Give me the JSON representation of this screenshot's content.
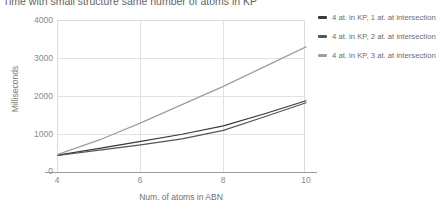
{
  "chart_data": {
    "type": "line",
    "title": "Time with small structure same number of atoms in KP",
    "xlabel": "Num. of atoms in ABN",
    "ylabel": "Milliseconds",
    "x": [
      4,
      5,
      6,
      7,
      8,
      9,
      10
    ],
    "xlim": [
      4,
      10
    ],
    "ylim": [
      0,
      4000
    ],
    "xticks": [
      "4",
      "6",
      "8",
      "10"
    ],
    "yticks": [
      "0",
      "1000",
      "2000",
      "3000",
      "4000"
    ],
    "grid": true,
    "legend_position": "right",
    "series": [
      {
        "name": "4 at. in KP, 1 at. at intersection",
        "color": "#3a3a3a",
        "values": [
          470,
          650,
          830,
          1020,
          1240,
          1560,
          1900
        ]
      },
      {
        "name": "4 at. in KP, 2 at. at intersection",
        "color": "#555555",
        "values": [
          460,
          600,
          740,
          900,
          1120,
          1480,
          1850
        ]
      },
      {
        "name": "4 at. in KP, 3 at. at intersection",
        "color": "#9e9e9e",
        "values": [
          490,
          870,
          1320,
          1800,
          2280,
          2800,
          3320
        ]
      }
    ]
  }
}
